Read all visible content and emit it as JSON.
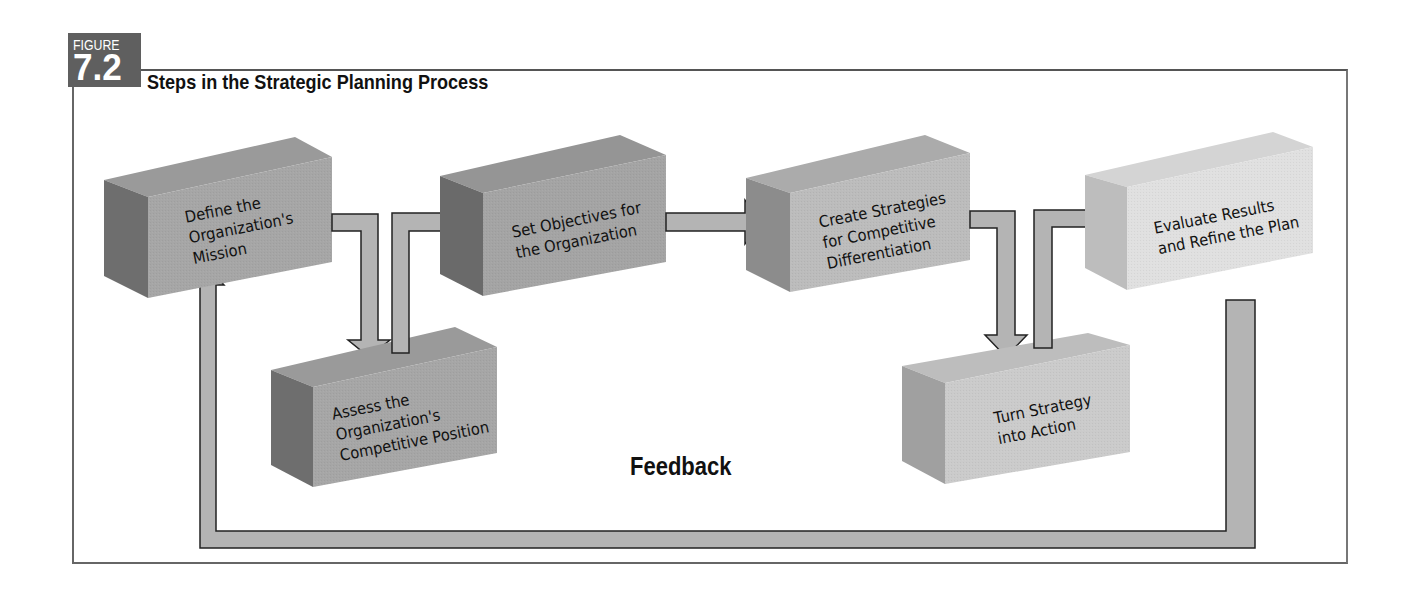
{
  "figure": {
    "label": "FIGURE",
    "number": "7.2",
    "title": "Steps in the Strategic Planning Process",
    "badge_color": "#5f5f5f"
  },
  "steps": [
    {
      "id": "define-mission",
      "label": "Define the\nOrganization's\nMission",
      "shade": "dark"
    },
    {
      "id": "assess-position",
      "label": "Assess the\nOrganization's\nCompetitive Position",
      "shade": "dark"
    },
    {
      "id": "set-objectives",
      "label": "Set Objectives for\nthe Organization",
      "shade": "dark"
    },
    {
      "id": "create-strategies",
      "label": "Create Strategies\nfor Competitive\nDifferentiation",
      "shade": "medium"
    },
    {
      "id": "turn-into-action",
      "label": "Turn Strategy\ninto Action",
      "shade": "light"
    },
    {
      "id": "evaluate-refine",
      "label": "Evaluate Results\nand Refine the Plan",
      "shade": "lightest"
    }
  ],
  "feedback_label": "Feedback",
  "colors": {
    "arrow_fill": "#b4b4b4",
    "arrow_stroke": "#222222",
    "frame": "#666666"
  }
}
